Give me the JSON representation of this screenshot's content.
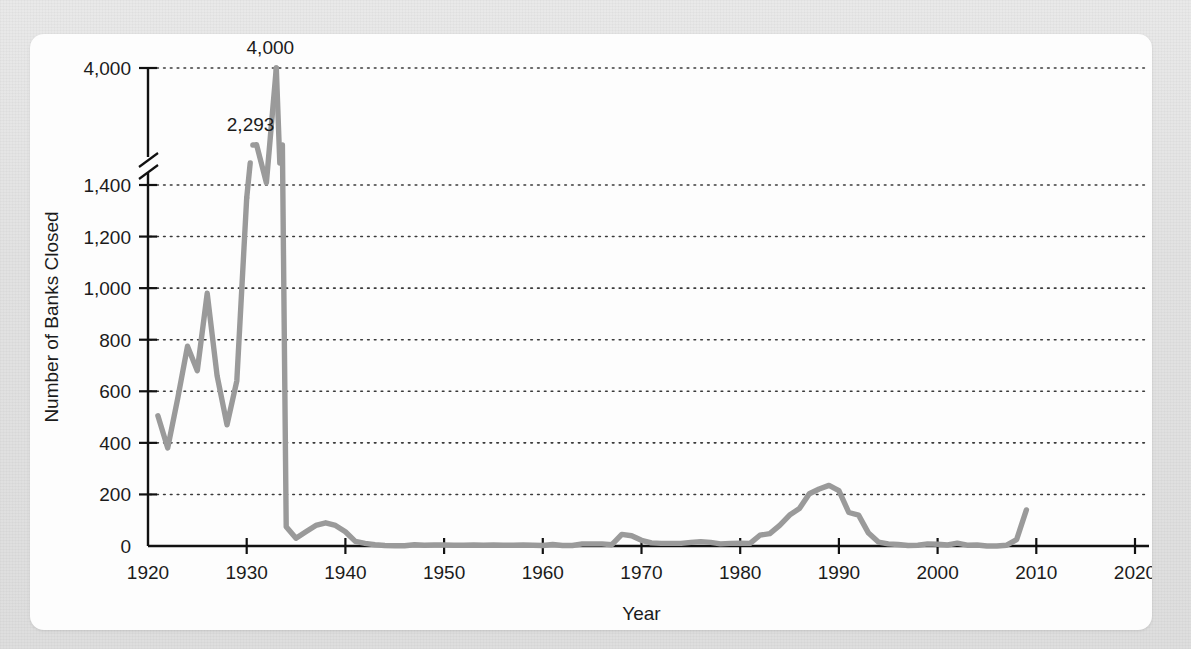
{
  "chart_data": {
    "type": "line",
    "title": "",
    "xlabel": "Year",
    "ylabel": "Number of Banks Closed",
    "xlim": [
      1920,
      2020
    ],
    "ylim": [
      0,
      4000
    ],
    "grid": true,
    "legend": "none",
    "axis_break": {
      "present": true,
      "between": [
        1400,
        4000
      ],
      "note": "y-axis broken between 1,400 and 4,000"
    },
    "xticks": [
      1920,
      1930,
      1940,
      1950,
      1960,
      1970,
      1980,
      1990,
      2000,
      2010,
      2020
    ],
    "xtick_labels": [
      "1920",
      "1930",
      "1940",
      "1950",
      "1960",
      "1970",
      "1980",
      "1990",
      "2000",
      "2010",
      "2020"
    ],
    "yticks": [
      0,
      200,
      400,
      600,
      800,
      1000,
      1200,
      1400,
      4000
    ],
    "ytick_labels": [
      "0",
      "200",
      "400",
      "600",
      "800",
      "1,000",
      "1,200",
      "1,400",
      "4,000"
    ],
    "annotations": [
      {
        "text": "4,000",
        "x": 1933,
        "y": 4000
      },
      {
        "text": "2,293",
        "x": 1931,
        "y": 2293
      }
    ],
    "series": [
      {
        "name": "Number of Banks Closed",
        "color": "#9a9a9a",
        "x": [
          1921,
          1922,
          1923,
          1924,
          1925,
          1926,
          1927,
          1928,
          1929,
          1930,
          1931,
          1932,
          1933,
          1934,
          1935,
          1936,
          1937,
          1938,
          1939,
          1940,
          1941,
          1942,
          1943,
          1944,
          1945,
          1946,
          1947,
          1948,
          1949,
          1950,
          1951,
          1952,
          1953,
          1954,
          1955,
          1956,
          1957,
          1958,
          1959,
          1960,
          1961,
          1962,
          1963,
          1964,
          1965,
          1966,
          1967,
          1968,
          1969,
          1970,
          1971,
          1972,
          1973,
          1974,
          1975,
          1976,
          1977,
          1978,
          1979,
          1980,
          1981,
          1982,
          1983,
          1984,
          1985,
          1986,
          1987,
          1988,
          1989,
          1990,
          1991,
          1992,
          1993,
          1994,
          1995,
          1996,
          1997,
          1998,
          1999,
          2000,
          2001,
          2002,
          2003,
          2004,
          2005,
          2006,
          2007,
          2008,
          2009
        ],
        "values": [
          505,
          380,
          570,
          775,
          680,
          980,
          660,
          470,
          640,
          1350,
          2293,
          1450,
          4000,
          75,
          30,
          55,
          80,
          90,
          80,
          55,
          18,
          10,
          5,
          2,
          1,
          1,
          5,
          3,
          4,
          4,
          3,
          3,
          4,
          3,
          4,
          3,
          3,
          4,
          3,
          2,
          6,
          2,
          2,
          8,
          8,
          8,
          5,
          45,
          40,
          22,
          12,
          10,
          10,
          10,
          14,
          17,
          14,
          8,
          10,
          11,
          10,
          42,
          48,
          80,
          120,
          145,
          203,
          221,
          235,
          215,
          130,
          120,
          50,
          15,
          8,
          6,
          2,
          3,
          8,
          7,
          4,
          11,
          3,
          4,
          0,
          0,
          3,
          25,
          140
        ]
      }
    ]
  },
  "axes": {
    "ylabel": "Number of Banks Closed",
    "xlabel": "Year"
  }
}
